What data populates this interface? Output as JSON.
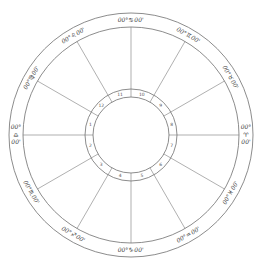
{
  "chart": {
    "center": [
      131,
      135
    ],
    "outer_radius": 122,
    "band_inner_radius": 108,
    "house_ring_outer_radius": 46,
    "house_ring_inner_radius": 38,
    "line_color": "#6e6e6e",
    "cusps": [
      {
        "house": 1,
        "angle": 180,
        "deg": "00°",
        "sign": "♎",
        "min": "00'"
      },
      {
        "house": 2,
        "angle": 210,
        "deg": "00°",
        "sign": "♏",
        "min": "00'"
      },
      {
        "house": 3,
        "angle": 240,
        "deg": "00°",
        "sign": "♐",
        "min": "00'"
      },
      {
        "house": 4,
        "angle": 270,
        "deg": "00°",
        "sign": "♑",
        "min": "00'"
      },
      {
        "house": 5,
        "angle": 300,
        "deg": "00°",
        "sign": "♒",
        "min": "00'"
      },
      {
        "house": 6,
        "angle": 330,
        "deg": "00°",
        "sign": "♓",
        "min": "00'"
      },
      {
        "house": 7,
        "angle": 0,
        "deg": "00°",
        "sign": "♈",
        "min": "00'"
      },
      {
        "house": 8,
        "angle": 30,
        "deg": "00°",
        "sign": "♉",
        "min": "00'"
      },
      {
        "house": 9,
        "angle": 60,
        "deg": "00°",
        "sign": "♊",
        "min": "00'"
      },
      {
        "house": 10,
        "angle": 90,
        "deg": "00°",
        "sign": "♋",
        "min": "00'"
      },
      {
        "house": 11,
        "angle": 120,
        "deg": "00°",
        "sign": "♌",
        "min": "00'"
      },
      {
        "house": 12,
        "angle": 150,
        "deg": "00°",
        "sign": "♍",
        "min": "00'"
      }
    ]
  }
}
